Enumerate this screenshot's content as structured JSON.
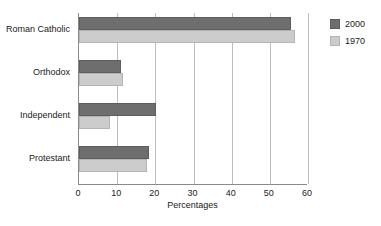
{
  "chart_data": {
    "type": "bar",
    "orientation": "horizontal",
    "title": "",
    "xlabel": "Percentages",
    "ylabel": "",
    "xlim": [
      0,
      60
    ],
    "xticks": [
      0,
      10,
      20,
      30,
      40,
      50,
      60
    ],
    "grid": true,
    "legend_position": "right",
    "categories": [
      "Roman Catholic",
      "Orthodox",
      "Independent",
      "Protestant"
    ],
    "series": [
      {
        "name": "2000",
        "color": "#6e6e6e",
        "values": [
          55.5,
          11.0,
          20.2,
          18.3
        ]
      },
      {
        "name": "1970",
        "color": "#cccccc",
        "values": [
          56.5,
          11.5,
          8.0,
          17.8
        ]
      }
    ]
  },
  "legend": {
    "entries": [
      {
        "label": "2000"
      },
      {
        "label": "1970"
      }
    ]
  },
  "axis": {
    "x_title": "Percentages",
    "tick_labels": [
      "0",
      "10",
      "20",
      "30",
      "40",
      "50",
      "60"
    ]
  },
  "categories": [
    {
      "label": "Roman Catholic"
    },
    {
      "label": "Orthodox"
    },
    {
      "label": "Independent"
    },
    {
      "label": "Protestant"
    }
  ]
}
